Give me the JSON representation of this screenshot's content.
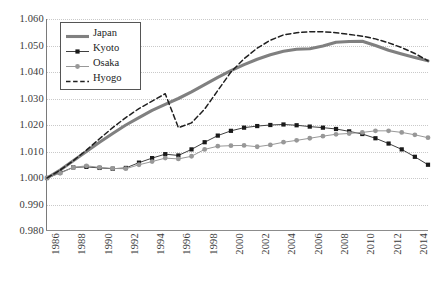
{
  "chart_data": {
    "type": "line",
    "title": "",
    "subtitle": "",
    "xlabel": "",
    "ylabel": "",
    "xlim": [
      1986,
      2015
    ],
    "ylim": [
      0.98,
      1.06
    ],
    "grid": true,
    "legend_position": "top-left",
    "y_ticks": [
      "1.060",
      "1.050",
      "1.040",
      "1.030",
      "1.020",
      "1.010",
      "1.000",
      "0.990",
      "0.980"
    ],
    "y_tick_values": [
      1.06,
      1.05,
      1.04,
      1.03,
      1.02,
      1.01,
      1.0,
      0.99,
      0.98
    ],
    "x_ticks": [
      "1986",
      "1988",
      "1990",
      "1992",
      "1994",
      "1996",
      "1998",
      "2000",
      "2002",
      "2004",
      "2006",
      "2008",
      "2010",
      "2012",
      "2014"
    ],
    "x_tick_values": [
      1986,
      1988,
      1990,
      1992,
      1994,
      1996,
      1998,
      2000,
      2002,
      2004,
      2006,
      2008,
      2010,
      2012,
      2014
    ],
    "x": [
      1986,
      1987,
      1988,
      1989,
      1990,
      1991,
      1992,
      1993,
      1994,
      1995,
      1996,
      1997,
      1998,
      1999,
      2000,
      2001,
      2002,
      2003,
      2004,
      2005,
      2006,
      2007,
      2008,
      2009,
      2010,
      2011,
      2012,
      2013,
      2014,
      2015
    ],
    "series": [
      {
        "name": "Japan",
        "color": "#808080",
        "style": "solid-thick",
        "marker": "none",
        "values": [
          1.0,
          1.003,
          1.0065,
          1.01,
          1.0135,
          1.0168,
          1.02,
          1.0228,
          1.0255,
          1.0278,
          1.03,
          1.0325,
          1.0352,
          1.038,
          1.0405,
          1.0428,
          1.0448,
          1.0465,
          1.0478,
          1.0486,
          1.0488,
          1.0498,
          1.0512,
          1.0515,
          1.0516,
          1.05,
          1.0482,
          1.0468,
          1.0455,
          1.0442
        ]
      },
      {
        "name": "Kyoto",
        "color": "#404040",
        "style": "solid-thin",
        "marker": "square",
        "values": [
          1.0,
          1.002,
          1.004,
          1.0042,
          1.0038,
          1.0035,
          1.0038,
          1.0058,
          1.0075,
          1.009,
          1.0085,
          1.0108,
          1.0135,
          1.016,
          1.0178,
          1.019,
          1.0196,
          1.02,
          1.0202,
          1.0199,
          1.0194,
          1.019,
          1.0185,
          1.0176,
          1.0166,
          1.015,
          1.013,
          1.0108,
          1.008,
          1.005
        ]
      },
      {
        "name": "Osaka",
        "color": "#989898",
        "style": "solid-thin",
        "marker": "circle",
        "values": [
          1.0,
          1.0018,
          1.004,
          1.0046,
          1.004,
          1.0036,
          1.0035,
          1.005,
          1.0062,
          1.0075,
          1.0072,
          1.0082,
          1.0108,
          1.012,
          1.0122,
          1.0123,
          1.0118,
          1.0125,
          1.0135,
          1.0142,
          1.015,
          1.0158,
          1.0165,
          1.0168,
          1.0172,
          1.0178,
          1.0178,
          1.0172,
          1.0163,
          1.0152
        ]
      },
      {
        "name": "Hyogo",
        "color": "#202020",
        "style": "dashed",
        "marker": "none",
        "values": [
          1.0,
          1.003,
          1.0065,
          1.0105,
          1.0148,
          1.019,
          1.0228,
          1.0262,
          1.029,
          1.0318,
          1.019,
          1.0208,
          1.026,
          1.033,
          1.04,
          1.045,
          1.049,
          1.052,
          1.054,
          1.0548,
          1.0552,
          1.0552,
          1.0548,
          1.0542,
          1.0535,
          1.0525,
          1.051,
          1.0492,
          1.047,
          1.0442
        ]
      }
    ],
    "annotations": []
  },
  "legend": {
    "items": [
      {
        "label": "Japan",
        "key": "line-thick-gray"
      },
      {
        "label": "Kyoto",
        "key": "line-square-black"
      },
      {
        "label": "Osaka",
        "key": "line-circle-gray"
      },
      {
        "label": "Hyogo",
        "key": "line-dashed-black"
      }
    ]
  }
}
